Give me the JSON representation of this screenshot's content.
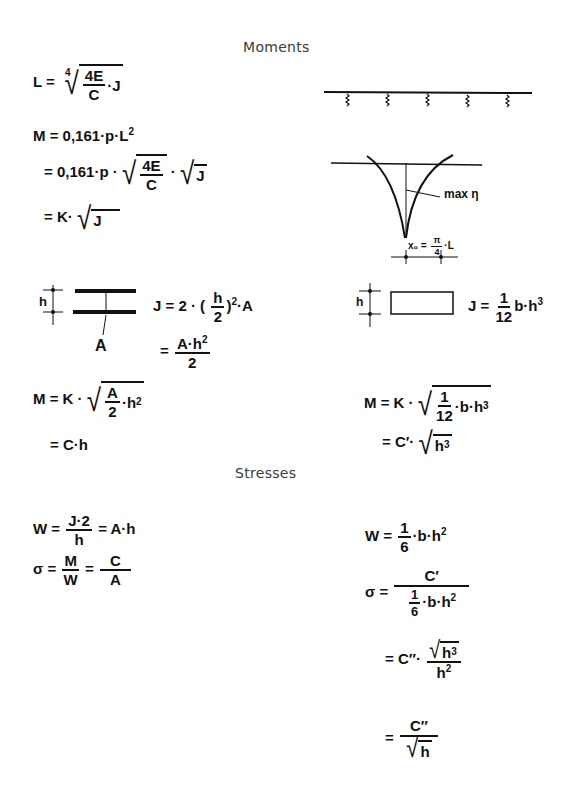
{
  "headings": {
    "moments": "Moments",
    "stresses": "Stresses"
  },
  "moments_left": {
    "eq_L": {
      "lhs": "L =",
      "root_index": "4",
      "num": "4E",
      "den": "C",
      "tail": "·J"
    },
    "eq_M1": {
      "text": "M = 0,161·p·L",
      "exp": "2"
    },
    "eq_M2": {
      "lhs": "= 0,161·p ·",
      "num": "4E",
      "den": "C",
      "mid": "·",
      "root2": "J"
    },
    "eq_M3": {
      "lhs": "= K·",
      "root": "J"
    },
    "section_label_h": "h",
    "section_label_A": "A",
    "eq_J1": {
      "lhs": "J = 2 · (",
      "num": "h",
      "den": "2",
      "rhs": ")",
      "exp": "2",
      "tail": "·A"
    },
    "eq_J2": {
      "lhs": "=",
      "num": "A·h",
      "exp": "2",
      "den": "2"
    },
    "eq_M4": {
      "lhs": "M = K ·",
      "num": "A",
      "den": "2",
      "tail": "·h",
      "exp": "2"
    },
    "eq_M5": {
      "text": "= C·h"
    }
  },
  "moments_right": {
    "diagram_label_max": "max η",
    "diagram_label_x0": {
      "lhs": "x₀ =",
      "num": "π",
      "den": "4",
      "tail": "·L"
    },
    "section_label_h": "h",
    "eq_J": {
      "lhs": "J =",
      "num": "1",
      "den": "12",
      "tail": "b·h",
      "exp": "3"
    },
    "eq_M1": {
      "lhs": "M = K ·",
      "num": "1",
      "den": "12",
      "tail": "·b·h",
      "exp": "3"
    },
    "eq_M2": {
      "lhs": "= C′·",
      "root": "h",
      "exp": "3"
    }
  },
  "stresses_left": {
    "eq_W": {
      "lhs": "W =",
      "num": "J·2",
      "den": "h",
      "rhs": "= A·h"
    },
    "eq_sigma": {
      "lhs": "σ =",
      "num1": "M",
      "den1": "W",
      "mid": "=",
      "num2": "C",
      "den2": "A"
    }
  },
  "stresses_right": {
    "eq_W": {
      "lhs": "W =",
      "num": "1",
      "den": "6",
      "tail": "·b·h",
      "exp": "2"
    },
    "eq_sigma1": {
      "lhs": "σ =",
      "num": "C′",
      "den_num": "1",
      "den_den": "6",
      "den_tail": "·b·h",
      "den_exp": "2"
    },
    "eq_sigma2": {
      "lhs": "= C″·",
      "num_root": "h",
      "num_exp": "3",
      "den": "h",
      "den_exp": "2"
    },
    "eq_sigma3": {
      "lhs": "=",
      "num": "C″",
      "den_root": "h"
    }
  }
}
